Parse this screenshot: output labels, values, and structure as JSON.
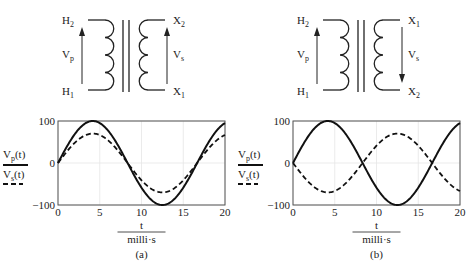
{
  "panels": [
    {
      "id": "a",
      "caption": "(a)",
      "transformer": {
        "primary_top": "H",
        "primary_top_sub": "2",
        "primary_bottom": "H",
        "primary_bottom_sub": "1",
        "primary_voltage": "V",
        "primary_voltage_sub": "p",
        "secondary_top": "X",
        "secondary_top_sub": "2",
        "secondary_bottom": "X",
        "secondary_bottom_sub": "1",
        "secondary_voltage": "V",
        "secondary_voltage_sub": "s",
        "secondary_arrow": "up"
      }
    },
    {
      "id": "b",
      "caption": "(b)",
      "transformer": {
        "primary_top": "H",
        "primary_top_sub": "2",
        "primary_bottom": "H",
        "primary_bottom_sub": "1",
        "primary_voltage": "V",
        "primary_voltage_sub": "p",
        "secondary_top": "X",
        "secondary_top_sub": "1",
        "secondary_bottom": "X",
        "secondary_bottom_sub": "2",
        "secondary_voltage": "V",
        "secondary_voltage_sub": "s",
        "secondary_arrow": "down"
      }
    }
  ],
  "legend": {
    "vp": "V",
    "vp_sub": "p",
    "vp_arg": "(t)",
    "vs": "V",
    "vs_sub": "s",
    "vs_arg": "(t)"
  },
  "xlabel_num": "t",
  "xlabel_den": "milli·s",
  "chart_data": [
    {
      "type": "line",
      "title": "(a)",
      "xlabel": "t / milli·s",
      "ylabel": "Vp(t), Vs(t)",
      "xlim": [
        0,
        20
      ],
      "ylim": [
        -100,
        100
      ],
      "xticks": [
        "0",
        "5",
        "10",
        "15",
        "20"
      ],
      "yticks": [
        "-100",
        "0",
        "100"
      ],
      "grid": true,
      "series": [
        {
          "name": "Vp(t)",
          "style": "solid",
          "amplitude": 100,
          "frequency_hz": 60,
          "phase_deg": 0
        },
        {
          "name": "Vs(t)",
          "style": "dashed",
          "amplitude": 70,
          "frequency_hz": 60,
          "phase_deg": 0
        }
      ]
    },
    {
      "type": "line",
      "title": "(b)",
      "xlabel": "t / milli·s",
      "ylabel": "Vp(t), Vs(t)",
      "xlim": [
        0,
        20
      ],
      "ylim": [
        -100,
        100
      ],
      "xticks": [
        "0",
        "5",
        "10",
        "15",
        "20"
      ],
      "yticks": [
        "-100",
        "0",
        "100"
      ],
      "grid": true,
      "series": [
        {
          "name": "Vp(t)",
          "style": "solid",
          "amplitude": 100,
          "frequency_hz": 60,
          "phase_deg": 0
        },
        {
          "name": "Vs(t)",
          "style": "dashed",
          "amplitude": -70,
          "frequency_hz": 60,
          "phase_deg": 0
        }
      ]
    }
  ]
}
